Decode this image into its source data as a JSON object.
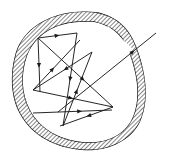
{
  "figure": {
    "type": "line-diagram",
    "width": 170,
    "height": 158,
    "background_color": "#ffffff",
    "stroke_color": "#1a1a1a",
    "hatch_color": "#2b2b2b",
    "wall": {
      "name": "cavity-wall",
      "description": "Closed irregular rounded-triangular shell drawn as two concentric contours with diagonal cross-hatching between them; a narrow gap in the upper-right wall lets one ray escape.",
      "wall_thickness_px": 9,
      "hatch_angle_deg": 45,
      "hatch_spacing_px": 2,
      "outer_contour": "M 96 12 C 118 16 130 30 136 46 C 146 72 150 100 140 122 C 130 142 106 152 82 150 C 56 148 32 136 20 114 C 10 96 10 72 16 52 C 24 28 52 8 96 12 Z",
      "inner_contour": "M 94 22 C 114 26 124 38 129 52 C 138 76 141 100 132 119 C 123 137 103 144 83 142 C 60 140 40 129 30 110 C 21 93 21 73 27 56 C 35 35 56 19 94 22 Z",
      "gap": {
        "name": "wall-gap",
        "description": "Opening in the upper-right wall where the escaping ray crosses",
        "center_x": 120,
        "center_y": 40
      }
    },
    "rays": {
      "description": "Straight ray segments with mid-segment arrowheads showing propagation direction; reflections occur at points on the inner wall.",
      "reflection_points": [
        {
          "name": "vertex-top-left",
          "x": 38,
          "y": 38
        },
        {
          "name": "vertex-top-right",
          "x": 77,
          "y": 33
        },
        {
          "name": "vertex-left",
          "x": 33,
          "y": 90
        },
        {
          "name": "vertex-bottom",
          "x": 63,
          "y": 126
        },
        {
          "name": "vertex-right",
          "x": 113,
          "y": 107
        },
        {
          "name": "vertex-upper-right",
          "x": 92,
          "y": 52
        }
      ],
      "segments": [
        {
          "name": "ray-top-left-to-top-right",
          "x1": 38,
          "y1": 38,
          "x2": 77,
          "y2": 33,
          "arrow_at": 0.55,
          "arrow_dir": "right"
        },
        {
          "name": "ray-top-right-to-bottom",
          "x1": 77,
          "y1": 33,
          "x2": 63,
          "y2": 126,
          "arrow_at": 0.52,
          "arrow_dir": "down"
        },
        {
          "name": "ray-bottom-to-upper-right",
          "x1": 63,
          "y1": 126,
          "x2": 92,
          "y2": 52,
          "arrow_at": 0.5,
          "arrow_dir": "up"
        },
        {
          "name": "ray-upper-right-to-left",
          "x1": 92,
          "y1": 52,
          "x2": 33,
          "y2": 90,
          "arrow_at": 0.48,
          "arrow_dir": "down-left"
        },
        {
          "name": "ray-left-to-right",
          "x1": 33,
          "y1": 90,
          "x2": 113,
          "y2": 107,
          "arrow_at": 0.5,
          "arrow_dir": "right"
        },
        {
          "name": "ray-top-left-to-right",
          "x1": 38,
          "y1": 38,
          "x2": 113,
          "y2": 107,
          "arrow_at": 0.62,
          "arrow_dir": "down-right"
        },
        {
          "name": "ray-right-to-bottom",
          "x1": 113,
          "y1": 107,
          "x2": 60,
          "y2": 126,
          "arrow_at": 0.5,
          "arrow_dir": "left"
        },
        {
          "name": "ray-bottom-horizontal",
          "x1": 33,
          "y1": 113,
          "x2": 112,
          "y2": 110,
          "arrow_at": 0.62,
          "arrow_dir": "right"
        },
        {
          "name": "ray-top-left-down",
          "x1": 38,
          "y1": 38,
          "x2": 40,
          "y2": 92,
          "arrow_at": 0.55,
          "arrow_dir": "down"
        },
        {
          "name": "ray-left-upward",
          "x1": 33,
          "y1": 90,
          "x2": 80,
          "y2": 40,
          "arrow_at": 0.45,
          "arrow_dir": "up-right"
        },
        {
          "name": "ray-exit-escaping",
          "x1": 58,
          "y1": 112,
          "x2": 156,
          "y2": 33,
          "arrow_at": 0.78,
          "arrow_dir": "up-right"
        }
      ]
    }
  }
}
